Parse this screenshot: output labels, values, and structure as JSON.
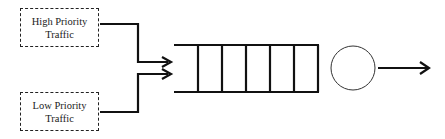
{
  "diagram": {
    "type": "priority-queue-scheduler",
    "sources": [
      {
        "id": "high",
        "label_line1": "High Priority",
        "label_line2": "Traffic"
      },
      {
        "id": "low",
        "label_line1": "Low Priority",
        "label_line2": "Traffic"
      }
    ],
    "queue": {
      "slots": 6
    },
    "server": {
      "shape": "circle"
    },
    "output": {
      "shape": "arrow"
    },
    "colors": {
      "stroke": "#111111",
      "background": "#ffffff",
      "text": "#222222"
    }
  }
}
